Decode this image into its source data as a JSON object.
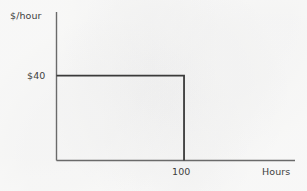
{
  "chart_data": {
    "type": "line",
    "title": "",
    "subtitle": "",
    "xlabel": "Hours",
    "ylabel": "$/hour",
    "xlim": [
      0,
      187
    ],
    "ylim": [
      0,
      70
    ],
    "grid": false,
    "legend": null,
    "x_ticks": [
      {
        "value": 100,
        "label": "100"
      }
    ],
    "y_ticks": [
      {
        "value": 40,
        "label": "$40"
      }
    ],
    "series": [
      {
        "name": "supply",
        "kind": "step",
        "color": "#3a3a3a",
        "points": [
          {
            "x": 0,
            "y": 40
          },
          {
            "x": 100,
            "y": 40
          },
          {
            "x": 100,
            "y": 0
          }
        ],
        "description": "Perfectly elastic at $40 up to 100 hours, then vertical"
      }
    ],
    "annotations": [],
    "axis_color": "#6a6a6a",
    "background_color": "#fbfbfa",
    "text_color": "#3e3e3e"
  },
  "labels": {
    "y_axis_title": "$/hour",
    "y_tick_40": "$40",
    "x_tick_100": "100",
    "x_axis_title": "Hours"
  }
}
